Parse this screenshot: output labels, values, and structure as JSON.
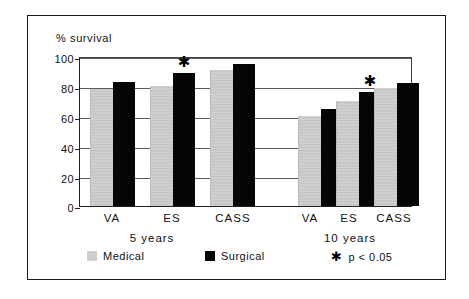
{
  "chart_data": {
    "type": "bar",
    "title": "",
    "ylabel": "% survival",
    "xlabel": "",
    "ylim": [
      0,
      100
    ],
    "yticks": [
      0,
      20,
      40,
      60,
      80,
      100
    ],
    "ytick_labels": [
      "0",
      "20",
      "40",
      "60",
      "80",
      "100"
    ],
    "grid": true,
    "legend_position": "below-axis",
    "categories": [
      "VA",
      "ES",
      "CASS",
      "VA",
      "ES",
      "CASS"
    ],
    "groups": [
      {
        "label": "5 years",
        "categories": [
          "VA",
          "ES",
          "CASS"
        ]
      },
      {
        "label": "10 years",
        "categories": [
          "VA",
          "ES",
          "CASS"
        ]
      }
    ],
    "series": [
      {
        "name": "Medical",
        "color": "#c9c9c9",
        "values": [
          78,
          80,
          91,
          60,
          70,
          79
        ]
      },
      {
        "name": "Surgical",
        "color": "#050505",
        "values": [
          83,
          89,
          95,
          65,
          76,
          82
        ]
      }
    ],
    "annotations": [
      {
        "symbol": "✱",
        "label": "p < 0.05",
        "group": "5 years",
        "category": "ES",
        "series": "Surgical",
        "value": 89
      },
      {
        "symbol": "✱",
        "label": "p < 0.05",
        "group": "10 years",
        "category": "ES",
        "series": "Surgical",
        "value": 76
      }
    ]
  },
  "legend": {
    "medical_label": "Medical",
    "surgical_label": "Surgical",
    "significance_symbol": "✱",
    "significance_label": "p < 0.05"
  },
  "axis": {
    "y_caption": "% survival",
    "tick_0": "0",
    "tick_20": "20",
    "tick_40": "40",
    "tick_60": "60",
    "tick_80": "80",
    "tick_100": "100"
  },
  "xlabels": {
    "g1_va": "VA",
    "g1_es": "ES",
    "g1_cass": "CASS",
    "g2_va": "VA",
    "g2_es": "ES",
    "g2_cass": "CASS",
    "group1": "5 years",
    "group2": "10 years"
  },
  "stars": {
    "star1": "✱",
    "star2": "✱"
  }
}
